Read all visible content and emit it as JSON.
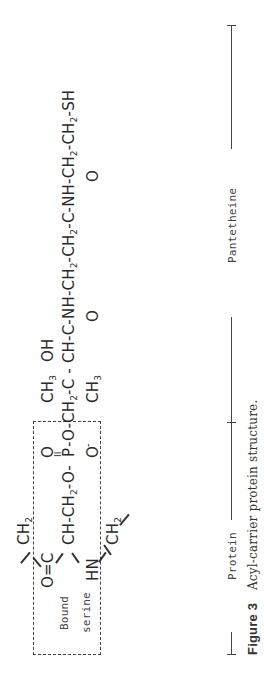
{
  "figure": {
    "label": "Figure 3",
    "caption": "Acyl-carrier protein structure."
  },
  "structure": {
    "box_label_line1": "Bound",
    "box_label_line2": "serine",
    "serine": {
      "top_ch2": "CH",
      "top_ch2_sub": "2",
      "carbonyl": "O=C",
      "alpha": "CH-CH",
      "alpha_sub": "2",
      "alpha_tail": "-O-",
      "amine": "HN",
      "bottom_ch2": "CH",
      "bottom_ch2_sub": "2"
    },
    "phosphate": {
      "p": "P",
      "o_top": "O",
      "double_bond": "II",
      "o_bottom": "O",
      "charge": "-",
      "ester_o": "-O-"
    },
    "pantetheine_chain": {
      "seg1": "CH",
      "seg1_sub": "2",
      "seg2": "-C - CH-C-NH-CH",
      "seg2_sub": "2",
      "seg3": "-CH",
      "seg3_sub": "2",
      "seg4": "-C-NH-CH",
      "seg4_sub": "2",
      "seg5": "-CH",
      "seg5_sub": "2",
      "seg6": "-SH",
      "methyl_top": "CH",
      "methyl_top_sub": "3",
      "hydroxyl": "OH",
      "methyl_bottom": "CH",
      "methyl_bottom_sub": "3",
      "carbonyl1_o": "O",
      "carbonyl2_o": "O",
      "double_bond": "II"
    }
  },
  "brackets": {
    "protein_label": "Protein",
    "pantetheine_label": "Pantetheine"
  }
}
